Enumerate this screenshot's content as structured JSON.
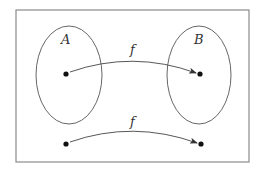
{
  "diagram": {
    "type": "function-mapping",
    "frame": {
      "x": 16,
      "y": 10,
      "width": 233,
      "height": 152,
      "stroke": "#888888"
    },
    "sets": [
      {
        "id": "A",
        "label": "A",
        "cx": 69,
        "cy": 75,
        "rx": 33,
        "ry": 49,
        "label_x": 66,
        "label_y": 40
      },
      {
        "id": "B",
        "label": "B",
        "cx": 199,
        "cy": 75,
        "rx": 32,
        "ry": 49,
        "label_x": 200,
        "label_y": 40
      }
    ],
    "points": [
      {
        "id": "a",
        "x": 66,
        "y": 74,
        "in_set": "A"
      },
      {
        "id": "b",
        "x": 200,
        "y": 74,
        "in_set": "B"
      },
      {
        "id": "p",
        "x": 66,
        "y": 144
      },
      {
        "id": "q",
        "x": 201,
        "y": 144
      }
    ],
    "arrows": [
      {
        "from": "a",
        "to": "b",
        "label": "f",
        "label_x": 133,
        "label_y": 54,
        "control_y": 55
      },
      {
        "from": "p",
        "to": "q",
        "label": "f",
        "label_x": 133,
        "label_y": 126,
        "control_y": 124
      }
    ]
  },
  "labels": {
    "set_a": "A",
    "set_b": "B",
    "arrow_top": "f",
    "arrow_bottom": "f"
  }
}
